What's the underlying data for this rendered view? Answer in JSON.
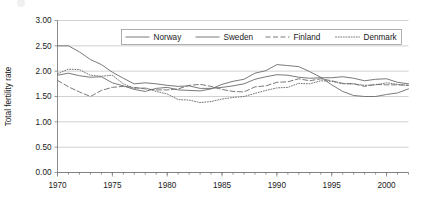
{
  "figure": {
    "background_color": "#ffffff",
    "line_color": "#6b6b6b",
    "grid_color": "#bdbdbd",
    "axis_color": "#6e6e6e",
    "text_color": "#1a1a1a"
  },
  "chart_data": {
    "type": "line",
    "title": "",
    "xlabel": "",
    "ylabel": "Total fertility rate",
    "xlim": [
      1970,
      2002
    ],
    "ylim": [
      0.0,
      3.0
    ],
    "ytick_values": [
      0.0,
      0.5,
      1.0,
      1.5,
      2.0,
      2.5,
      3.0
    ],
    "ytick_labels": [
      "0.00",
      "0.50",
      "1.00",
      "1.50",
      "2.00",
      "2.50",
      "3.00"
    ],
    "xtick_values": [
      1970,
      1975,
      1980,
      1985,
      1990,
      1995,
      2000
    ],
    "xtick_labels": [
      "1970",
      "1975",
      "1980",
      "1985",
      "1990",
      "1995",
      "2000"
    ],
    "xminor_step": 1,
    "grid": "horizontal",
    "legend_position": "top-center",
    "x": [
      1970,
      1971,
      1972,
      1973,
      1974,
      1975,
      1976,
      1977,
      1978,
      1979,
      1980,
      1981,
      1982,
      1983,
      1984,
      1985,
      1986,
      1987,
      1988,
      1989,
      1990,
      1991,
      1992,
      1993,
      1994,
      1995,
      1996,
      1997,
      1998,
      1999,
      2000,
      2001,
      2002
    ],
    "series": [
      {
        "name": "Norway",
        "style": "solid",
        "values": [
          2.5,
          2.5,
          2.38,
          2.23,
          2.13,
          1.98,
          1.86,
          1.75,
          1.77,
          1.75,
          1.72,
          1.7,
          1.71,
          1.66,
          1.66,
          1.68,
          1.71,
          1.75,
          1.84,
          1.89,
          1.93,
          1.92,
          1.88,
          1.86,
          1.87,
          1.87,
          1.89,
          1.86,
          1.81,
          1.84,
          1.85,
          1.78,
          1.75
        ]
      },
      {
        "name": "Sweden",
        "style": "solid",
        "values": [
          1.92,
          1.96,
          1.91,
          1.88,
          1.89,
          1.77,
          1.71,
          1.64,
          1.6,
          1.66,
          1.68,
          1.63,
          1.62,
          1.61,
          1.65,
          1.74,
          1.8,
          1.84,
          1.96,
          2.01,
          2.13,
          2.11,
          2.09,
          1.99,
          1.88,
          1.73,
          1.6,
          1.52,
          1.5,
          1.5,
          1.54,
          1.57,
          1.65
        ]
      },
      {
        "name": "Finland",
        "style": "dashed",
        "values": [
          1.82,
          1.69,
          1.59,
          1.5,
          1.62,
          1.68,
          1.7,
          1.68,
          1.65,
          1.63,
          1.63,
          1.65,
          1.72,
          1.74,
          1.7,
          1.64,
          1.6,
          1.59,
          1.69,
          1.71,
          1.78,
          1.79,
          1.85,
          1.81,
          1.85,
          1.81,
          1.76,
          1.75,
          1.7,
          1.74,
          1.73,
          1.73,
          1.72
        ]
      },
      {
        "name": "Denmark",
        "style": "dotted",
        "values": [
          1.95,
          2.04,
          2.03,
          1.92,
          1.9,
          1.92,
          1.75,
          1.66,
          1.67,
          1.6,
          1.55,
          1.44,
          1.43,
          1.38,
          1.4,
          1.45,
          1.48,
          1.5,
          1.56,
          1.62,
          1.67,
          1.68,
          1.76,
          1.75,
          1.81,
          1.8,
          1.75,
          1.75,
          1.72,
          1.73,
          1.77,
          1.74,
          1.72
        ]
      }
    ]
  },
  "legend": {
    "entries": [
      {
        "label": "Norway",
        "style": "solid"
      },
      {
        "label": "Sweden",
        "style": "solid"
      },
      {
        "label": "Finland",
        "style": "dashed"
      },
      {
        "label": "Denmark",
        "style": "dotted"
      }
    ]
  }
}
